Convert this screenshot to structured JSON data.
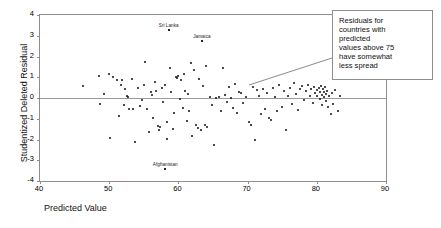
{
  "chart_data": {
    "type": "scatter",
    "title": "",
    "xlabel": "Predicted Value",
    "ylabel": "Studentized Deleted Residual",
    "xlim": [
      40,
      90
    ],
    "ylim": [
      -4,
      4
    ],
    "xticks": [
      40,
      50,
      60,
      70,
      80,
      90
    ],
    "yticks": [
      4,
      3,
      2,
      1,
      0,
      -1,
      -2,
      -3,
      -4
    ],
    "grid": false,
    "legend": null,
    "reference_line": {
      "y": 0,
      "color": "#9a9a9a"
    },
    "marker": {
      "shape": "circle",
      "color": "#111111",
      "size": 2
    },
    "annotations": [
      {
        "text": "Residuals for countries with predicted values above 75 have somewhat less spread",
        "box": true,
        "leader_to": [
          74.5,
          1.35
        ]
      }
    ],
    "point_labels": [
      {
        "label": "Sri Lanka",
        "x": 58.6,
        "y": 3.3
      },
      {
        "label": "Jamaica",
        "x": 63.4,
        "y": 2.75
      },
      {
        "label": "Afghanistan",
        "x": 58.1,
        "y": -3.4
      }
    ],
    "points": [
      [
        46.2,
        0.57
      ],
      [
        48.5,
        1.05
      ],
      [
        48.6,
        -0.28
      ],
      [
        49.3,
        0.2
      ],
      [
        50.0,
        1.18
      ],
      [
        50.1,
        -1.95
      ],
      [
        50.6,
        1.02
      ],
      [
        51.1,
        0.85
      ],
      [
        51.4,
        -0.87
      ],
      [
        51.7,
        0.65
      ],
      [
        51.9,
        0.88
      ],
      [
        52.1,
        -0.32
      ],
      [
        52.3,
        0.42
      ],
      [
        52.6,
        0.12
      ],
      [
        52.7,
        0.05
      ],
      [
        52.9,
        -0.52
      ],
      [
        53.3,
        0.9
      ],
      [
        53.5,
        -0.55
      ],
      [
        53.8,
        -2.1
      ],
      [
        54.2,
        0.5
      ],
      [
        54.5,
        -0.38
      ],
      [
        54.7,
        -0.08
      ],
      [
        55.0,
        0.62
      ],
      [
        55.2,
        1.72
      ],
      [
        55.4,
        -0.55
      ],
      [
        55.7,
        -1.62
      ],
      [
        56.0,
        0.28
      ],
      [
        56.2,
        0.13
      ],
      [
        56.4,
        -0.95
      ],
      [
        56.6,
        0.75
      ],
      [
        56.8,
        0.35
      ],
      [
        57.0,
        -1.35
      ],
      [
        57.2,
        -1.55
      ],
      [
        57.4,
        -1.42
      ],
      [
        57.6,
        0.48
      ],
      [
        57.8,
        -0.2
      ],
      [
        58.0,
        0.62
      ],
      [
        58.1,
        -3.4
      ],
      [
        58.3,
        -1.98
      ],
      [
        58.4,
        -1.15
      ],
      [
        58.6,
        3.3
      ],
      [
        58.8,
        1.45
      ],
      [
        59.0,
        0.3
      ],
      [
        59.2,
        -1.48
      ],
      [
        59.4,
        -0.72
      ],
      [
        59.6,
        1.0
      ],
      [
        59.8,
        0.95
      ],
      [
        60.0,
        1.05
      ],
      [
        60.2,
        -0.05
      ],
      [
        60.4,
        0.85
      ],
      [
        60.6,
        -0.48
      ],
      [
        60.8,
        1.18
      ],
      [
        61.0,
        0.32
      ],
      [
        61.2,
        -1.1
      ],
      [
        61.4,
        0.18
      ],
      [
        61.6,
        -0.62
      ],
      [
        61.8,
        1.68
      ],
      [
        62.0,
        -1.85
      ],
      [
        62.2,
        1.35
      ],
      [
        62.5,
        -1.32
      ],
      [
        62.8,
        -1.45
      ],
      [
        63.0,
        0.9
      ],
      [
        63.2,
        -1.55
      ],
      [
        63.4,
        2.75
      ],
      [
        63.6,
        0.6
      ],
      [
        63.8,
        -1.28
      ],
      [
        64.0,
        1.55
      ],
      [
        64.2,
        -1.4
      ],
      [
        64.5,
        0.05
      ],
      [
        64.8,
        -0.35
      ],
      [
        65.1,
        -2.25
      ],
      [
        65.4,
        0.0
      ],
      [
        65.8,
        0.03
      ],
      [
        66.2,
        -0.62
      ],
      [
        66.5,
        1.45
      ],
      [
        66.8,
        0.15
      ],
      [
        67.0,
        -0.18
      ],
      [
        67.3,
        0.55
      ],
      [
        67.6,
        0.0
      ],
      [
        67.9,
        -0.5
      ],
      [
        68.2,
        0.68
      ],
      [
        68.5,
        -0.72
      ],
      [
        68.8,
        0.3
      ],
      [
        69.1,
        0.22
      ],
      [
        69.4,
        -0.22
      ],
      [
        69.8,
        0.05
      ],
      [
        70.2,
        -1.15
      ],
      [
        70.5,
        -1.3
      ],
      [
        70.8,
        0.55
      ],
      [
        71.0,
        -2.0
      ],
      [
        71.3,
        0.38
      ],
      [
        71.6,
        0.1
      ],
      [
        71.9,
        -0.75
      ],
      [
        72.2,
        0.42
      ],
      [
        72.5,
        -0.55
      ],
      [
        72.8,
        0.22
      ],
      [
        73.1,
        -0.95
      ],
      [
        73.4,
        -1.05
      ],
      [
        73.7,
        0.5
      ],
      [
        74.0,
        0.05
      ],
      [
        74.3,
        -0.65
      ],
      [
        74.6,
        0.62
      ],
      [
        74.9,
        -0.42
      ],
      [
        75.2,
        0.35
      ],
      [
        75.5,
        -1.55
      ],
      [
        75.8,
        0.1
      ],
      [
        76.1,
        0.5
      ],
      [
        76.4,
        -0.3
      ],
      [
        76.7,
        0.72
      ],
      [
        77.0,
        0.2
      ],
      [
        77.3,
        -0.58
      ],
      [
        77.6,
        0.42
      ],
      [
        77.9,
        0.58
      ],
      [
        78.2,
        -0.12
      ],
      [
        78.5,
        0.32
      ],
      [
        78.8,
        0.65
      ],
      [
        79.0,
        0.08
      ],
      [
        79.2,
        0.45
      ],
      [
        79.4,
        -0.25
      ],
      [
        79.6,
        0.55
      ],
      [
        79.8,
        0.22
      ],
      [
        80.0,
        0.38
      ],
      [
        80.1,
        0.12
      ],
      [
        80.3,
        0.48
      ],
      [
        80.4,
        -0.05
      ],
      [
        80.5,
        0.28
      ],
      [
        80.6,
        0.6
      ],
      [
        80.7,
        0.15
      ],
      [
        80.8,
        -0.35
      ],
      [
        80.9,
        0.42
      ],
      [
        81.0,
        0.05
      ],
      [
        81.1,
        0.3
      ],
      [
        81.2,
        0.52
      ],
      [
        81.3,
        -0.15
      ],
      [
        81.4,
        0.2
      ],
      [
        81.5,
        0.35
      ],
      [
        81.6,
        -0.45
      ],
      [
        81.8,
        0.1
      ],
      [
        82.0,
        -0.75
      ],
      [
        82.2,
        0.25
      ],
      [
        82.4,
        -0.28
      ],
      [
        82.6,
        0.4
      ],
      [
        83.0,
        -0.62
      ],
      [
        83.4,
        0.12
      ]
    ]
  },
  "axes": {
    "x_title": "Predicted Value",
    "y_title": "Studentized Deleted Residual"
  },
  "annotation": {
    "line1": "Residuals for",
    "line2": "countries with",
    "line3": "predicted",
    "line4": "values above 75",
    "line5": "have somewhat",
    "line6": "less spread"
  }
}
